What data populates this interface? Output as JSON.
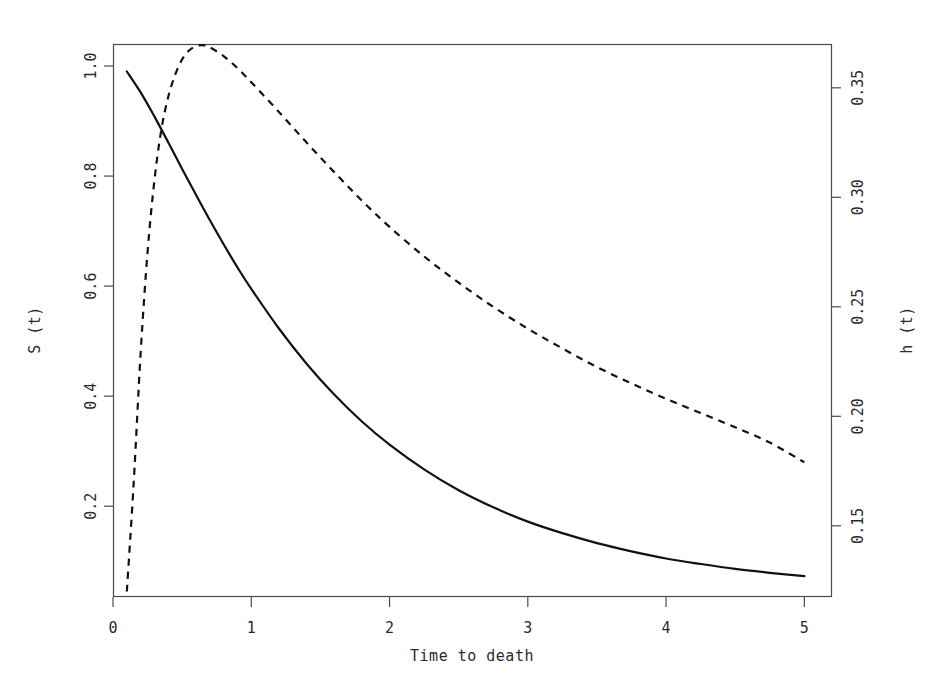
{
  "figure": {
    "background": "#ffffff",
    "plot_box": {
      "left": 113,
      "top": 44,
      "right": 832,
      "bottom": 597
    },
    "series_colors": {
      "survival": "#111111",
      "hazard": "#111111"
    }
  },
  "chart_data": {
    "type": "line",
    "title": "",
    "subtitle": "",
    "xlabel": "Time to death",
    "ylabel": "S (t)",
    "y2label": "h (t)",
    "xlim": [
      0,
      5.2
    ],
    "xticks": [
      0,
      1,
      2,
      3,
      4,
      5
    ],
    "xticklabels": [
      "0",
      "1",
      "2",
      "3",
      "4",
      "5"
    ],
    "ylim": [
      0.035,
      1.04
    ],
    "yticks": [
      1.0,
      0.8,
      0.6,
      0.4,
      0.2
    ],
    "yticklabels": [
      "1.0",
      "0.8",
      "0.6",
      "0.4",
      "0.2"
    ],
    "y2lim": [
      0.1175,
      0.37
    ],
    "y2ticks": [
      0.35,
      0.3,
      0.25,
      0.2,
      0.15
    ],
    "y2ticklabels": [
      "0.35",
      "0.30",
      "0.25",
      "0.20",
      "0.15"
    ],
    "grid": false,
    "legend": "none",
    "series": [
      {
        "name": "S (t)",
        "label": "S (t)",
        "axis": "left",
        "style": "solid",
        "linewidth": 2.2,
        "x": [
          0.1,
          0.2,
          0.3,
          0.4,
          0.5,
          0.6,
          0.7,
          0.8,
          0.9,
          1.0,
          1.2,
          1.4,
          1.6,
          1.8,
          2.0,
          2.25,
          2.5,
          2.75,
          3.0,
          3.25,
          3.5,
          3.75,
          4.0,
          4.25,
          4.5,
          4.75,
          5.0
        ],
        "y": [
          0.99,
          0.952,
          0.908,
          0.861,
          0.813,
          0.766,
          0.72,
          0.676,
          0.634,
          0.595,
          0.523,
          0.459,
          0.403,
          0.354,
          0.312,
          0.267,
          0.229,
          0.198,
          0.172,
          0.151,
          0.133,
          0.118,
          0.105,
          0.095,
          0.086,
          0.079,
          0.073
        ]
      },
      {
        "name": "h (t)",
        "label": "h (t)",
        "axis": "right",
        "style": "dashed",
        "linewidth": 2.2,
        "dash_pattern": "7 6",
        "x": [
          0.1,
          0.15,
          0.2,
          0.25,
          0.3,
          0.35,
          0.4,
          0.45,
          0.5,
          0.55,
          0.6,
          0.65,
          0.7,
          0.8,
          0.9,
          1.0,
          1.2,
          1.4,
          1.6,
          1.8,
          2.0,
          2.25,
          2.5,
          2.75,
          3.0,
          3.25,
          3.5,
          3.75,
          4.0,
          4.25,
          4.5,
          4.75,
          5.0
        ],
        "y": [
          0.12,
          0.17,
          0.229,
          0.275,
          0.308,
          0.331,
          0.346,
          0.356,
          0.363,
          0.367,
          0.369,
          0.3695,
          0.3685,
          0.3645,
          0.359,
          0.3525,
          0.339,
          0.325,
          0.3115,
          0.2985,
          0.2865,
          0.273,
          0.261,
          0.25,
          0.24,
          0.231,
          0.2225,
          0.215,
          0.208,
          0.2015,
          0.195,
          0.188,
          0.179
        ]
      }
    ],
    "annotations": []
  }
}
